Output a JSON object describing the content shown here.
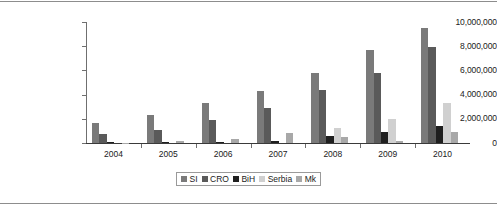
{
  "chart_data": {
    "type": "bar",
    "title": "",
    "subtitle": "",
    "xlabel": "",
    "ylabel": "",
    "categories": [
      "2004",
      "2005",
      "2006",
      "2007",
      "2008",
      "2009",
      "2010"
    ],
    "ylim": [
      0,
      10000000
    ],
    "yticks": [
      0,
      2000000,
      4000000,
      6000000,
      8000000,
      10000000
    ],
    "ytick_labels": [
      "0",
      "2,000,000",
      "4,000,000",
      "6,000,000",
      "8,000,000",
      "10,000,000"
    ],
    "grid": false,
    "legend_position": "bottom",
    "series": [
      {
        "name": "SI",
        "color": "#7a7a7a",
        "values": [
          1650000,
          2350000,
          3300000,
          4300000,
          5800000,
          7700000,
          9500000
        ]
      },
      {
        "name": "CRO",
        "color": "#5a5a5a",
        "values": [
          750000,
          1050000,
          1900000,
          2900000,
          4400000,
          5800000,
          7900000
        ]
      },
      {
        "name": "BiH",
        "color": "#1f1f1f",
        "values": [
          60000,
          90000,
          120000,
          180000,
          620000,
          900000,
          1400000
        ]
      },
      {
        "name": "Serbia",
        "color": "#d0d0d0",
        "values": [
          0,
          0,
          0,
          0,
          1200000,
          2000000,
          3300000
        ]
      },
      {
        "name": "Mk",
        "color": "#a8a8a8",
        "values": [
          30000,
          130000,
          320000,
          850000,
          500000,
          170000,
          900000
        ]
      }
    ]
  },
  "legend": {
    "entries": [
      {
        "label": "SI"
      },
      {
        "label": "CRO"
      },
      {
        "label": "BiH"
      },
      {
        "label": "Serbia"
      },
      {
        "label": "Mk"
      }
    ]
  }
}
